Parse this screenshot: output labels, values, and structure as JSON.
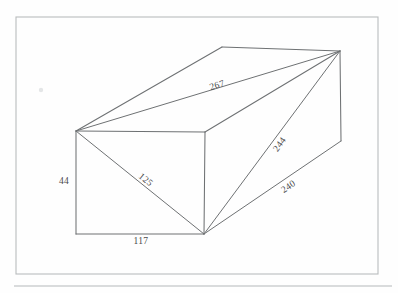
{
  "document": {
    "title": "Rectangular Prism with Diagonals",
    "background_color": "#fefefe",
    "frame_color": "#b9bcbd",
    "line_color": "#6e7173",
    "label_color": "#4a4a4a"
  },
  "frame": {
    "name": "page-border",
    "x": 16,
    "y": 17,
    "width": 362,
    "height": 257
  },
  "rule": {
    "name": "horizontal-rule",
    "x1": 14,
    "y1": 286,
    "x2": 392,
    "y2": 286
  },
  "figure": {
    "kind": "rectangular-prism-wireframe",
    "vertices": {
      "front_top_left": {
        "x": 76,
        "y": 131
      },
      "front_top_right": {
        "x": 205,
        "y": 132
      },
      "front_bottom_left": {
        "x": 76,
        "y": 234
      },
      "front_bottom_right": {
        "x": 204,
        "y": 234
      },
      "back_top_left": {
        "x": 222,
        "y": 47
      },
      "back_top_right": {
        "x": 340,
        "y": 51
      },
      "back_bottom_right": {
        "x": 341,
        "y": 141
      }
    },
    "edges": [
      {
        "name": "front-face-top",
        "from": "front_top_left",
        "to": "front_top_right"
      },
      {
        "name": "front-face-left",
        "from": "front_top_left",
        "to": "front_bottom_left"
      },
      {
        "name": "front-face-bottom",
        "from": "front_bottom_left",
        "to": "front_bottom_right"
      },
      {
        "name": "front-face-right",
        "from": "front_top_right",
        "to": "front_bottom_right"
      },
      {
        "name": "top-face-left",
        "from": "front_top_left",
        "to": "back_top_left"
      },
      {
        "name": "top-face-back",
        "from": "back_top_left",
        "to": "back_top_right"
      },
      {
        "name": "top-face-right",
        "from": "front_top_right",
        "to": "back_top_right"
      },
      {
        "name": "right-face-vertical",
        "from": "back_top_right",
        "to": "back_bottom_right"
      }
    ],
    "diagonals": [
      {
        "name": "space-diagonal-267",
        "from": "front_top_left",
        "to": "back_top_right",
        "label": "267"
      },
      {
        "name": "face-diagonal-125",
        "from": "front_top_left",
        "to": "front_bottom_right",
        "label": "125"
      },
      {
        "name": "space-diagonal-244",
        "from": "front_bottom_right",
        "to": "back_top_right",
        "label": "244"
      },
      {
        "name": "face-diagonal-240",
        "from": "front_bottom_right",
        "to": "back_bottom_right",
        "label": "240"
      }
    ]
  },
  "labels": {
    "height": {
      "text": "44",
      "x": 64,
      "y": 184,
      "rotation": 0
    },
    "width": {
      "text": "117",
      "x": 141,
      "y": 244,
      "rotation": 0
    },
    "face_diagonal_front": {
      "text": "125",
      "x": 144,
      "y": 182,
      "rotation": 39
    },
    "top_diagonal": {
      "text": "267",
      "x": 218,
      "y": 88,
      "rotation": -18
    },
    "space_diagonal": {
      "text": "244",
      "x": 282,
      "y": 146,
      "rotation": -54
    },
    "depth_diagonal": {
      "text": "240",
      "x": 290,
      "y": 189,
      "rotation": -34
    }
  },
  "artifact": {
    "name": "scan-speck",
    "x": 41,
    "y": 90,
    "r": 2.2
  }
}
